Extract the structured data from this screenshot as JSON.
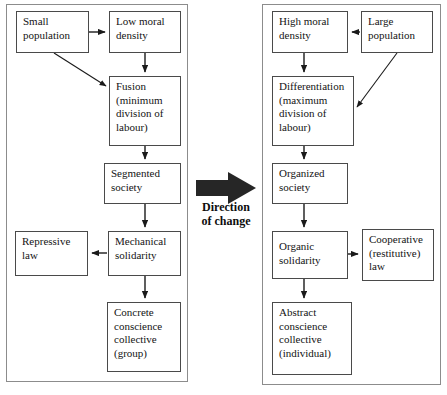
{
  "figure": {
    "type": "flow-diagram",
    "title_visible": false,
    "center_label": "Direction\nof change",
    "center_label_lines": [
      "Direction",
      "of change"
    ],
    "colors": {
      "background": "#ffffff",
      "panel_border": "#8c8c8c",
      "node_border": "#4a4a4a",
      "text": "#141414",
      "arrow": "#1a1a1a",
      "big_arrow": "#262626"
    }
  },
  "panels": [
    {
      "id": "left-panel",
      "name": "mechanical-solidarity-panel",
      "x": 6,
      "y": 4,
      "w": 182,
      "h": 378
    },
    {
      "id": "right-panel",
      "name": "organic-solidarity-panel",
      "x": 262,
      "y": 4,
      "w": 179,
      "h": 381
    }
  ],
  "nodes": [
    {
      "id": "small-population",
      "name": "node-small-population",
      "label": "Small\npopulation",
      "x": 16,
      "y": 11,
      "w": 73,
      "h": 42
    },
    {
      "id": "low-moral-density",
      "name": "node-low-moral-density",
      "label": "Low moral\ndensity",
      "x": 109,
      "y": 11,
      "w": 72,
      "h": 42
    },
    {
      "id": "fusion",
      "name": "node-fusion",
      "label": "Fusion\n(minimum\ndivision of\nlabour)",
      "x": 109,
      "y": 76,
      "w": 72,
      "h": 70
    },
    {
      "id": "segmented-society",
      "name": "node-segmented-society",
      "label": "Segmented\nsociety",
      "x": 104,
      "y": 163,
      "w": 77,
      "h": 41
    },
    {
      "id": "repressive-law",
      "name": "node-repressive-law",
      "label": "Repressive\nlaw",
      "x": 15,
      "y": 231,
      "w": 73,
      "h": 45
    },
    {
      "id": "mechanical-solidarity",
      "name": "node-mechanical-solidarity",
      "label": "Mechanical\nsolidarity",
      "x": 108,
      "y": 231,
      "w": 73,
      "h": 45
    },
    {
      "id": "concrete-conscience",
      "name": "node-concrete-conscience",
      "label": "Concrete\nconscience\ncollective\n(group)",
      "x": 107,
      "y": 302,
      "w": 74,
      "h": 70
    },
    {
      "id": "high-moral-density",
      "name": "node-high-moral-density",
      "label": "High moral\ndensity",
      "x": 272,
      "y": 11,
      "w": 76,
      "h": 42
    },
    {
      "id": "large-population",
      "name": "node-large-population",
      "label": "Large\npopulation",
      "x": 361,
      "y": 11,
      "w": 72,
      "h": 42
    },
    {
      "id": "differentiation",
      "name": "node-differentiation",
      "label": "Differentiation\n(maximum\ndivision of\nlabour)",
      "x": 272,
      "y": 76,
      "w": 82,
      "h": 70
    },
    {
      "id": "organized-society",
      "name": "node-organized-society",
      "label": "Organized\nsociety",
      "x": 272,
      "y": 163,
      "w": 76,
      "h": 41
    },
    {
      "id": "organic-solidarity",
      "name": "node-organic-solidarity",
      "label": "Organic\nsolidarity",
      "x": 272,
      "y": 231,
      "w": 76,
      "h": 48
    },
    {
      "id": "cooperative-law",
      "name": "node-cooperative-law",
      "label": "Cooperative\n(restitutive)\nlaw",
      "x": 362,
      "y": 229,
      "w": 72,
      "h": 52
    },
    {
      "id": "abstract-conscience",
      "name": "node-abstract-conscience",
      "label": "Abstract\nconscience\ncollective\n(individual)",
      "x": 272,
      "y": 302,
      "w": 80,
      "h": 73
    }
  ],
  "edges": [
    {
      "name": "edge-small-population-to-low-moral-density",
      "from": "small-population",
      "to": "low-moral-density",
      "kind": "straight-arrow"
    },
    {
      "name": "edge-small-population-to-fusion",
      "from": "small-population",
      "to": "fusion",
      "kind": "diagonal-arrow"
    },
    {
      "name": "edge-low-moral-density-to-fusion",
      "from": "low-moral-density",
      "to": "fusion",
      "kind": "straight-arrow"
    },
    {
      "name": "edge-fusion-to-segmented-society",
      "from": "fusion",
      "to": "segmented-society",
      "kind": "straight-arrow"
    },
    {
      "name": "edge-segmented-society-to-mechanical-solidarity",
      "from": "segmented-society",
      "to": "mechanical-solidarity",
      "kind": "straight-arrow"
    },
    {
      "name": "edge-mechanical-solidarity-to-repressive-law",
      "from": "mechanical-solidarity",
      "to": "repressive-law",
      "kind": "straight-arrow"
    },
    {
      "name": "edge-mechanical-solidarity-to-concrete-conscience",
      "from": "mechanical-solidarity",
      "to": "concrete-conscience",
      "kind": "straight-arrow"
    },
    {
      "name": "edge-large-population-to-high-moral-density",
      "from": "large-population",
      "to": "high-moral-density",
      "kind": "straight-arrow"
    },
    {
      "name": "edge-large-population-to-differentiation",
      "from": "large-population",
      "to": "differentiation",
      "kind": "diagonal-arrow"
    },
    {
      "name": "edge-high-moral-density-to-differentiation",
      "from": "high-moral-density",
      "to": "differentiation",
      "kind": "straight-arrow"
    },
    {
      "name": "edge-differentiation-to-organized-society",
      "from": "differentiation",
      "to": "organized-society",
      "kind": "straight-arrow"
    },
    {
      "name": "edge-organized-society-to-organic-solidarity",
      "from": "organized-society",
      "to": "organic-solidarity",
      "kind": "straight-arrow"
    },
    {
      "name": "edge-organic-solidarity-to-cooperative-law",
      "from": "organic-solidarity",
      "to": "cooperative-law",
      "kind": "straight-arrow"
    },
    {
      "name": "edge-organic-solidarity-to-abstract-conscience",
      "from": "organic-solidarity",
      "to": "abstract-conscience",
      "kind": "straight-arrow"
    }
  ]
}
